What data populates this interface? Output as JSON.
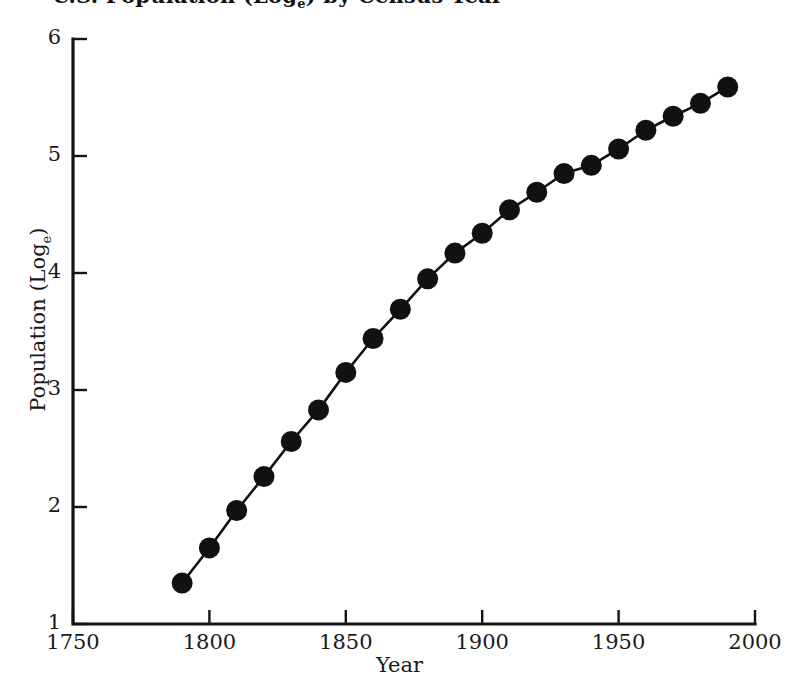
{
  "chart_data": {
    "type": "line",
    "title_main": "U.S. Population (Log",
    "title_sub": "e",
    "title_tail": ") by Census Year",
    "xlabel": "Year",
    "ylabel": "Population (Logₑ)",
    "ylabel_main": "Population (Log",
    "ylabel_sub": "e",
    "ylabel_tail": ")",
    "xlim": [
      1750,
      2000
    ],
    "ylim": [
      1,
      6
    ],
    "xticks": [
      1750,
      1800,
      1850,
      1900,
      1950,
      2000
    ],
    "yticks": [
      1,
      2,
      3,
      4,
      5,
      6
    ],
    "xtick_labels": [
      "1750",
      "1800",
      "1850",
      "1900",
      "1950",
      "2000"
    ],
    "ytick_labels": [
      "1",
      "2",
      "3",
      "4",
      "5",
      "6"
    ],
    "grid": false,
    "legend": false,
    "marker": "filled-circle",
    "marker_color": "#111111",
    "line_color": "#111111",
    "x": [
      1790,
      1800,
      1810,
      1820,
      1830,
      1840,
      1850,
      1860,
      1870,
      1880,
      1890,
      1900,
      1910,
      1920,
      1930,
      1940,
      1950,
      1960,
      1970,
      1980,
      1990
    ],
    "values": [
      1.35,
      1.65,
      1.97,
      2.26,
      2.56,
      2.83,
      3.15,
      3.44,
      3.69,
      3.95,
      4.17,
      4.34,
      4.54,
      4.69,
      4.85,
      4.92,
      5.06,
      5.22,
      5.34,
      5.45,
      5.59
    ],
    "series": [
      {
        "name": "U.S. Population (Logₑ)",
        "values": [
          1.35,
          1.65,
          1.97,
          2.26,
          2.56,
          2.83,
          3.15,
          3.44,
          3.69,
          3.95,
          4.17,
          4.34,
          4.54,
          4.69,
          4.85,
          4.92,
          5.06,
          5.22,
          5.34,
          5.45,
          5.59
        ]
      }
    ]
  },
  "figure": {
    "background_color": "#ffffff",
    "axis_color": "#141414"
  }
}
